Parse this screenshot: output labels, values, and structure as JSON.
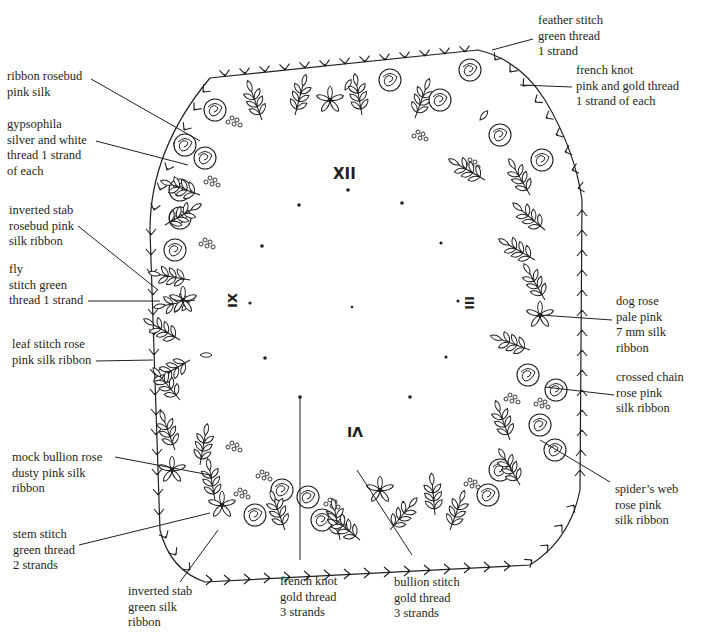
{
  "diagram": {
    "type": "embroidery pattern",
    "ink_color": "#231f20",
    "background": "#ffffff"
  },
  "clock": {
    "numerals": {
      "twelve": "XII",
      "three": "III",
      "six": "VI",
      "nine": "IX"
    },
    "hour_dots": 12
  },
  "labels": {
    "feather_stitch": [
      "feather stitch",
      "green thread",
      "1 strand"
    ],
    "french_knot_top": [
      "french knot",
      "pink and gold thread",
      "1 strand of each"
    ],
    "ribbon_rosebud": [
      "ribbon rosebud",
      "pink silk"
    ],
    "gypsophila": [
      "gypsophila",
      "silver and white",
      "thread 1 strand",
      "of each"
    ],
    "inverted_stab_rosebud": [
      "inverted stab",
      "rosebud pink",
      "silk ribbon"
    ],
    "fly_stitch": [
      "fly",
      "stitch green",
      "thread 1 strand"
    ],
    "leaf_stitch": [
      "leaf stitch rose",
      "pink silk ribbon"
    ],
    "mock_bullion": [
      "mock bullion rose",
      "dusty pink silk",
      "ribbon"
    ],
    "stem_stitch": [
      "stem stitch",
      "green thread",
      "2 strands"
    ],
    "inverted_stab_green": [
      "inverted stab",
      "green silk",
      "ribbon"
    ],
    "french_knot_bottom": [
      "french knot",
      "gold thread",
      "3 strands"
    ],
    "bullion_stitch": [
      "bullion stitch",
      "gold thread",
      "3 strands"
    ],
    "dog_rose": [
      "dog rose",
      "pale pink",
      "7 mm silk",
      "ribbon"
    ],
    "crossed_chain": [
      "crossed chain",
      "rose pink",
      "silk ribbon"
    ],
    "spiders_web": [
      "spider’s web",
      "rose pink",
      "silk ribbon"
    ]
  },
  "label_text": {
    "feather_stitch": "feather stitch\ngreen thread\n1 strand",
    "french_knot_top": "french knot\npink and gold thread\n1 strand of each",
    "ribbon_rosebud": "ribbon rosebud\npink silk",
    "gypsophila": "gypsophila\nsilver and white\nthread 1 strand\nof each",
    "inverted_stab_rosebud": "inverted stab\nrosebud pink\nsilk ribbon",
    "fly_stitch": "fly\nstitch green\nthread 1 strand",
    "leaf_stitch": "leaf stitch rose\npink silk ribbon",
    "mock_bullion": "mock bullion rose\ndusty pink silk\nribbon",
    "stem_stitch": "stem stitch\ngreen thread\n2 strands",
    "inverted_stab_green": "inverted stab\ngreen silk\nribbon",
    "french_knot_bottom": "french knot\ngold thread\n3 strands",
    "bullion_stitch": "bullion stitch\ngold thread\n3 strands",
    "dog_rose": "dog rose\npale pink\n7 mm silk\nribbon",
    "crossed_chain": "crossed chain\nrose pink\nsilk ribbon",
    "spiders_web": "spider’s web\nrose pink\nsilk ribbon"
  }
}
